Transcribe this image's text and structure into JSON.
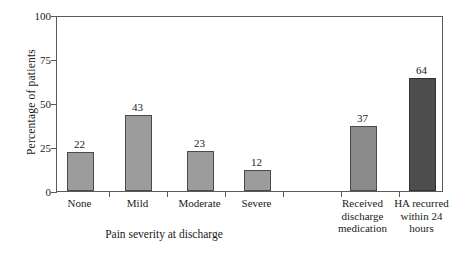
{
  "chart_data": {
    "type": "bar",
    "title": "",
    "xlabel": "Pain severity at discharge",
    "ylabel": "Percentage of patients",
    "ylim": [
      0,
      100
    ],
    "yticks": [
      0,
      25,
      50,
      75,
      100
    ],
    "ytick_labels": [
      "0",
      "25",
      "50",
      "75",
      "100"
    ],
    "grid": false,
    "legend": "none",
    "categories": [
      "None",
      "Mild",
      "Moderate",
      "Severe",
      "Received\ndischarge\nmedication",
      "HA recurred\nwithin 24\nhours"
    ],
    "values": [
      22,
      43,
      23,
      12,
      37,
      64
    ],
    "value_labels": [
      "22",
      "43",
      "23",
      "12",
      "37",
      "64"
    ],
    "bar_colors": [
      "#9c9c9c",
      "#9c9c9c",
      "#9c9c9c",
      "#9c9c9c",
      "#8a8a8a",
      "#4d4d4d"
    ],
    "groups": [
      {
        "name": "Pain severity at discharge",
        "categories": [
          "None",
          "Mild",
          "Moderate",
          "Severe"
        ]
      },
      {
        "name": "",
        "categories": [
          "Received discharge medication",
          "HA recurred within 24 hours"
        ]
      }
    ],
    "bars": [
      {
        "label": "None",
        "value": 22,
        "shade": "light",
        "x": 66,
        "w": 27
      },
      {
        "label": "Mild",
        "value": 43,
        "shade": "light",
        "x": 124,
        "w": 27
      },
      {
        "label": "Moderate",
        "value": 23,
        "shade": "light",
        "x": 186,
        "w": 27
      },
      {
        "label": "Severe",
        "value": 12,
        "shade": "light",
        "x": 243,
        "w": 27
      },
      {
        "label": "Received discharge medication",
        "value": 37,
        "shade": "mid",
        "x": 349,
        "w": 27
      },
      {
        "label": "HA recurred within 24 hours",
        "value": 64,
        "shade": "dark",
        "x": 408,
        "w": 27
      }
    ]
  }
}
